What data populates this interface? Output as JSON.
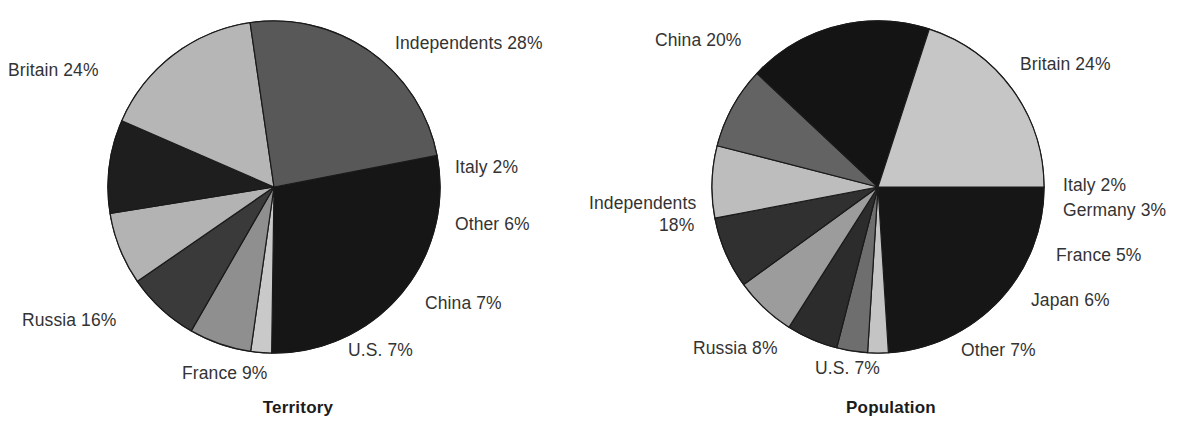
{
  "page": {
    "background": "#ffffff",
    "text_color": "#333333"
  },
  "charts": [
    {
      "id": "territory",
      "title": "Territory",
      "center": {
        "x": 274,
        "y": 187
      },
      "radius": 166,
      "labels": [
        {
          "text": "Independents 28%",
          "x": 395,
          "y": 33,
          "align": "left"
        },
        {
          "text": "Britain 24%",
          "x": 8,
          "y": 60,
          "align": "left"
        },
        {
          "text": "Italy 2%",
          "x": 455,
          "y": 157,
          "align": "left"
        },
        {
          "text": "Other 6%",
          "x": 455,
          "y": 214,
          "align": "left"
        },
        {
          "text": "China 7%",
          "x": 425,
          "y": 293,
          "align": "left"
        },
        {
          "text": "U.S. 7%",
          "x": 348,
          "y": 340,
          "align": "left"
        },
        {
          "text": "France 9%",
          "x": 182,
          "y": 363,
          "align": "left"
        },
        {
          "text": "Russia 16%",
          "x": 22,
          "y": 310,
          "align": "left"
        }
      ]
    },
    {
      "id": "population",
      "title": "Population",
      "center": {
        "x": 285,
        "y": 187
      },
      "radius": 166,
      "labels": [
        {
          "text": "China 20%",
          "x": 62,
          "y": 30,
          "align": "left"
        },
        {
          "text": "Britain 24%",
          "x": 427,
          "y": 54,
          "align": "left"
        },
        {
          "text": "Italy 2%",
          "x": 470,
          "y": 175,
          "align": "left"
        },
        {
          "text": "Germany 3%",
          "x": 470,
          "y": 200,
          "align": "left"
        },
        {
          "text": "France 5%",
          "x": 463,
          "y": 245,
          "align": "left"
        },
        {
          "text": "Japan 6%",
          "x": 438,
          "y": 290,
          "align": "left"
        },
        {
          "text": "Other 7%",
          "x": 368,
          "y": 340,
          "align": "left"
        },
        {
          "text": "U.S. 7%",
          "x": 222,
          "y": 358,
          "align": "left"
        },
        {
          "text": "Russia 8%",
          "x": 100,
          "y": 338,
          "align": "left"
        },
        {
          "text": "Independents",
          "x": -4,
          "y": 193,
          "align": "left"
        },
        {
          "text": "18%",
          "x": 66,
          "y": 215,
          "align": "left"
        }
      ]
    }
  ],
  "chart_data": [
    {
      "type": "pie",
      "title": "Territory",
      "id": "territory",
      "start_angle": -11,
      "direction": "clockwise",
      "labels": [
        "Independents",
        "Italy",
        "Other",
        "China",
        "U.S.",
        "France",
        "Russia",
        "Britain"
      ],
      "values": [
        28,
        2,
        6,
        7,
        7,
        9,
        16,
        24
      ],
      "unit": "%",
      "display_labels": [
        "Independents 28%",
        "Italy 2%",
        "Other 6%",
        "China 7%",
        "U.S. 7%",
        "France 9%",
        "Russia 16%",
        "Britain 24%"
      ],
      "colors": [
        "#161616",
        "#c9c9c9",
        "#8f8f8f",
        "#3a3a3a",
        "#b3b3b3",
        "#1e1e1e",
        "#b6b6b6",
        "#585858"
      ],
      "legend": "none",
      "grid": false
    },
    {
      "type": "pie",
      "title": "Population",
      "id": "population",
      "start_angle": 0,
      "direction": "clockwise",
      "labels": [
        "Britain",
        "Italy",
        "Germany",
        "France",
        "Japan",
        "Other",
        "U.S.",
        "Russia",
        "Independents",
        "China"
      ],
      "values": [
        24,
        2,
        3,
        5,
        6,
        7,
        7,
        8,
        18,
        20
      ],
      "unit": "%",
      "display_labels": [
        "Britain 24%",
        "Italy 2%",
        "Germany 3%",
        "France 5%",
        "Japan 6%",
        "Other 7%",
        "U.S. 7%",
        "Russia 8%",
        "Independents 18%",
        "China 20%"
      ],
      "colors": [
        "#161616",
        "#c4c4c4",
        "#6e6e6e",
        "#2c2c2c",
        "#9c9c9c",
        "#303030",
        "#bdbdbd",
        "#636363",
        "#141414",
        "#c6c6c6"
      ],
      "legend": "none",
      "grid": false
    }
  ],
  "palette": {
    "near_black": "#161616",
    "dark_gray": "#303030",
    "mid_gray": "#6e6e6e",
    "light_gray": "#bdbdbd",
    "pale_gray": "#c9c9c9",
    "outline": "#1a1a1a"
  }
}
